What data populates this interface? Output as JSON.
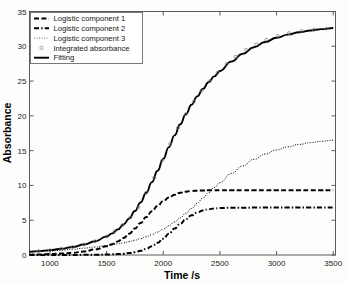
{
  "chart_data": {
    "type": "line",
    "title": "",
    "xlabel": "Time /s",
    "ylabel": "Absorbance",
    "xlim": [
      820,
      3520
    ],
    "ylim": [
      0,
      35
    ],
    "xticks": [
      1000,
      1500,
      2000,
      2500,
      3000,
      3500
    ],
    "yticks": [
      0,
      5,
      10,
      15,
      20,
      25,
      30,
      35
    ],
    "grid": false,
    "legend_position": "upper-left",
    "x": [
      820,
      900,
      1000,
      1100,
      1200,
      1300,
      1400,
      1500,
      1550,
      1600,
      1650,
      1700,
      1750,
      1800,
      1850,
      1900,
      1950,
      2000,
      2050,
      2100,
      2150,
      2200,
      2250,
      2300,
      2350,
      2400,
      2450,
      2500,
      2600,
      2700,
      2800,
      2900,
      3000,
      3100,
      3200,
      3300,
      3400,
      3500
    ],
    "series": [
      {
        "name": "Logistic component 1",
        "style": "dashed",
        "values": [
          0.05,
          0.08,
          0.13,
          0.2,
          0.32,
          0.5,
          0.8,
          1.25,
          1.55,
          1.95,
          2.45,
          3.05,
          3.8,
          4.6,
          5.45,
          6.3,
          7.05,
          7.75,
          8.25,
          8.65,
          8.95,
          9.1,
          9.2,
          9.25,
          9.28,
          9.3,
          9.3,
          9.3,
          9.3,
          9.3,
          9.3,
          9.3,
          9.3,
          9.3,
          9.3,
          9.3,
          9.3,
          9.3
        ]
      },
      {
        "name": "Logistic component 2",
        "style": "dashdot",
        "values": [
          0.0,
          0.0,
          0.0,
          0.01,
          0.01,
          0.02,
          0.03,
          0.06,
          0.09,
          0.13,
          0.19,
          0.28,
          0.4,
          0.6,
          0.88,
          1.25,
          1.75,
          2.35,
          3.05,
          3.8,
          4.5,
          5.15,
          5.7,
          6.1,
          6.4,
          6.58,
          6.68,
          6.74,
          6.79,
          6.8,
          6.81,
          6.82,
          6.82,
          6.82,
          6.82,
          6.82,
          6.82,
          6.82
        ]
      },
      {
        "name": "Logistic component 3",
        "style": "dotted",
        "values": [
          0.42,
          0.48,
          0.57,
          0.68,
          0.82,
          0.98,
          1.15,
          1.35,
          1.47,
          1.6,
          1.75,
          1.92,
          2.12,
          2.35,
          2.62,
          2.93,
          3.3,
          3.72,
          4.2,
          4.75,
          5.35,
          6.0,
          6.7,
          7.45,
          8.2,
          8.95,
          9.7,
          10.4,
          11.7,
          12.8,
          13.75,
          14.5,
          15.1,
          15.55,
          15.9,
          16.15,
          16.35,
          16.5
        ]
      },
      {
        "name": "Fitting",
        "style": "solid",
        "values": [
          0.47,
          0.56,
          0.7,
          0.89,
          1.15,
          1.5,
          1.98,
          2.66,
          3.11,
          3.68,
          4.39,
          5.25,
          6.32,
          7.55,
          8.95,
          10.48,
          12.1,
          13.82,
          15.5,
          17.2,
          18.8,
          20.25,
          21.6,
          22.8,
          23.88,
          24.83,
          25.68,
          26.44,
          27.79,
          28.91,
          29.86,
          30.62,
          31.22,
          31.67,
          32.02,
          32.27,
          32.47,
          32.62
        ]
      },
      {
        "name": "Integrated absorbance",
        "style": "circle-marker",
        "marker_x": [
          900,
          1000,
          1100,
          1200,
          1300,
          1400,
          1500,
          1570,
          1640,
          1710,
          1780,
          1850,
          1920,
          1990,
          2060,
          2130,
          2200,
          2270,
          2340,
          2410,
          2480,
          2560,
          2640,
          2730,
          2820,
          2910,
          3010,
          3110,
          3220,
          3330,
          3440
        ],
        "marker_y": [
          0.56,
          0.7,
          0.89,
          1.15,
          1.5,
          1.98,
          2.66,
          3.4,
          4.28,
          5.4,
          6.85,
          8.95,
          11.1,
          13.55,
          15.95,
          18.25,
          20.25,
          22.05,
          23.65,
          25.0,
          26.2,
          27.45,
          28.5,
          29.5,
          30.3,
          30.95,
          31.5,
          31.9,
          32.2,
          32.4,
          32.55
        ]
      }
    ]
  },
  "axes": {
    "xlabel": "Time /s",
    "ylabel": "Absorbance",
    "x_tick_labels": [
      "1000",
      "1500",
      "2000",
      "2500",
      "3000",
      "3500"
    ],
    "y_tick_labels": [
      "0",
      "5",
      "10",
      "15",
      "20",
      "25",
      "30",
      "35"
    ]
  },
  "legend": {
    "items": [
      {
        "label": "Logistic component 1",
        "key": "dashed-line-key"
      },
      {
        "label": "Logistic component 2",
        "key": "dashdot-line-key"
      },
      {
        "label": "Logistic component 3",
        "key": "dotted-line-key"
      },
      {
        "label": "Integrated absorbance",
        "key": "circle-marker-key"
      },
      {
        "label": "Fitting",
        "key": "solid-line-key"
      }
    ]
  },
  "colors": {
    "curve": "#000000",
    "axis": "#5a5a5a",
    "marker": "#7c7c7c",
    "background": "#fdfdfc"
  }
}
